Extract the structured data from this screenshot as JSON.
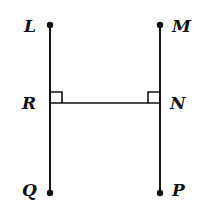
{
  "diagram": {
    "type": "geometry-figure",
    "colors": {
      "stroke": "#111111",
      "background": "#ffffff"
    },
    "points": {
      "L": {
        "label": "L",
        "x": 50,
        "y": 25
      },
      "M": {
        "label": "M",
        "x": 160,
        "y": 25
      },
      "R": {
        "label": "R",
        "x": 50,
        "y": 103
      },
      "N": {
        "label": "N",
        "x": 160,
        "y": 103
      },
      "Q": {
        "label": "Q",
        "x": 50,
        "y": 193
      },
      "P": {
        "label": "P",
        "x": 160,
        "y": 193
      }
    },
    "segments": [
      {
        "from": "L",
        "to": "Q"
      },
      {
        "from": "M",
        "to": "P"
      },
      {
        "from": "R",
        "to": "N"
      }
    ],
    "right_angles": [
      {
        "at": "R",
        "between": [
          "R-L",
          "R-N"
        ]
      },
      {
        "at": "N",
        "between": [
          "N-M",
          "N-R"
        ]
      }
    ],
    "endpoint_dots": [
      "L",
      "M",
      "Q",
      "P"
    ]
  }
}
